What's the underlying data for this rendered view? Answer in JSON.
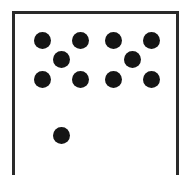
{
  "figure": {
    "frame": {
      "color": "#2a2a2a"
    },
    "dot_color": "#141414",
    "dot_radius": 8.5,
    "dots": [
      {
        "group": "upper-left-quincunx",
        "x": 42,
        "y": 40
      },
      {
        "group": "upper-left-quincunx",
        "x": 80,
        "y": 40
      },
      {
        "group": "upper-left-quincunx",
        "x": 61,
        "y": 59
      },
      {
        "group": "upper-left-quincunx",
        "x": 42,
        "y": 79
      },
      {
        "group": "upper-left-quincunx",
        "x": 80,
        "y": 79
      },
      {
        "group": "upper-right-quincunx",
        "x": 113,
        "y": 40
      },
      {
        "group": "upper-right-quincunx",
        "x": 151,
        "y": 40
      },
      {
        "group": "upper-right-quincunx",
        "x": 132,
        "y": 59
      },
      {
        "group": "upper-right-quincunx",
        "x": 113,
        "y": 79
      },
      {
        "group": "upper-right-quincunx",
        "x": 151,
        "y": 79
      },
      {
        "group": "single",
        "x": 61,
        "y": 135
      }
    ],
    "dot_count": 11
  }
}
